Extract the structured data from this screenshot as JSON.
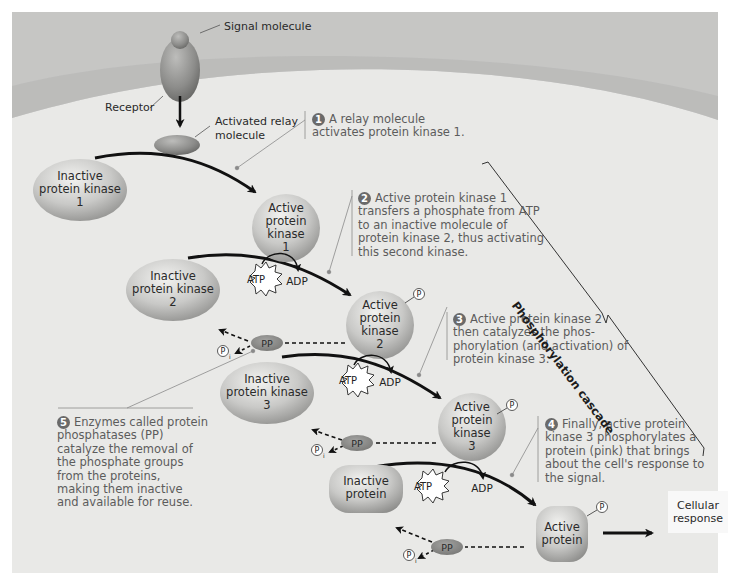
{
  "figure": {
    "title": "Phosphorylation cascade",
    "colors": {
      "panel_bg": "#e9e9e7",
      "membrane_outer": "#c4c4c2",
      "membrane_band": "#b6b6b4",
      "protein_fill_light": "#eeeeec",
      "protein_fill_dark": "#8f8f8d",
      "pp_fill": "#8a8a88",
      "arrow": "#111111",
      "callout_text": "#5c5c5c"
    }
  },
  "labels": {
    "signal_molecule": "Signal molecule",
    "receptor": "Receptor",
    "activated_relay": "Activated relay\nmolecule",
    "inactive_pk1": "Inactive\nprotein kinase\n1",
    "active_pk1": "Active\nprotein\nkinase\n1",
    "inactive_pk2": "Inactive\nprotein kinase\n2",
    "active_pk2": "Active\nprotein\nkinase\n2",
    "inactive_pk3": "Inactive\nprotein kinase\n3",
    "active_pk3": "Active\nprotein\nkinase\n3",
    "inactive_protein": "Inactive\nprotein",
    "active_protein": "Active\nprotein",
    "cellular_response": "Cellular\nresponse",
    "atp": "ATP",
    "adp": "ADP",
    "pp": "PP",
    "phosphate": "P",
    "phosphate_i_sub": "i",
    "cascade": "Phosphorylation cascade"
  },
  "steps": [
    {
      "num": "1",
      "text": "A relay molecule\nactivates protein kinase 1."
    },
    {
      "num": "2",
      "text": "Active protein kinase 1\ntransfers a phosphate from ATP\nto an inactive molecule of\nprotein kinase 2, thus activating\nthis second kinase."
    },
    {
      "num": "3",
      "text": "Active protein kinase 2\nthen catalyzes the phos-\nphorylation (and activation) of\nprotein kinase 3."
    },
    {
      "num": "4",
      "text": "Finally, active protein\nkinase 3 phosphorylates a\nprotein (pink) that brings\nabout the cell's response to\nthe signal."
    },
    {
      "num": "5",
      "text": "Enzymes called protein\nphosphatases (PP)\ncatalyze the removal of\nthe phosphate groups\nfrom the proteins,\nmaking them inactive\nand available for reuse."
    }
  ]
}
